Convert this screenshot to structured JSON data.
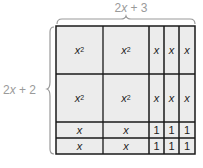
{
  "labels": {
    "width": {
      "coef": "2",
      "var": "x",
      "rest": " + 3"
    },
    "height": {
      "coef": "2",
      "var": "x",
      "rest": " + 2"
    }
  },
  "colors": {
    "cell_fill": "#ececec",
    "grid_line": "#1a1a1a",
    "label_text": "#9a9a9a",
    "brace": "#9a9a9a"
  },
  "grid": {
    "columns": [
      {
        "x": 56,
        "w": 47
      },
      {
        "x": 103,
        "w": 46
      },
      {
        "x": 149,
        "w": 15
      },
      {
        "x": 164,
        "w": 15
      },
      {
        "x": 179,
        "w": 16
      }
    ],
    "rows": [
      {
        "y": 26,
        "h": 48
      },
      {
        "y": 74,
        "h": 48
      },
      {
        "y": 122,
        "h": 16
      },
      {
        "y": 138,
        "h": 16
      }
    ],
    "cells": [
      [
        "x²",
        "x²",
        "x",
        "x",
        "x"
      ],
      [
        "x²",
        "x²",
        "x",
        "x",
        "x"
      ],
      [
        "x",
        "x",
        "1",
        "1",
        "1"
      ],
      [
        "x",
        "x",
        "1",
        "1",
        "1"
      ]
    ]
  }
}
